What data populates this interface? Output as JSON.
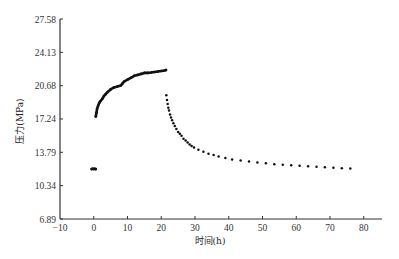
{
  "chart_data": {
    "type": "scatter",
    "title": "",
    "xlabel": "时间(h)",
    "ylabel": "压力(MPa)",
    "xlim": [
      -10,
      85
    ],
    "ylim": [
      6.89,
      27.58
    ],
    "xticks": [
      -10,
      0,
      10,
      20,
      30,
      40,
      50,
      60,
      70,
      80
    ],
    "yticks": [
      6.89,
      10.34,
      13.79,
      17.24,
      20.68,
      24.13,
      27.58
    ],
    "ytick_labels": [
      "6.89",
      "10.34",
      "13.79",
      "17.24",
      "20.68",
      "24.13",
      "27.58"
    ],
    "grid": false,
    "legend": null,
    "series": [
      {
        "name": "initial",
        "points": [
          [
            -0.6,
            12.05
          ],
          [
            -0.3,
            12.08
          ],
          [
            0.0,
            12.06
          ],
          [
            0.3,
            12.07
          ],
          [
            0.6,
            12.05
          ]
        ]
      },
      {
        "name": "buildup",
        "points": [
          [
            0.6,
            17.5
          ],
          [
            0.8,
            17.9
          ],
          [
            1.0,
            18.3
          ],
          [
            1.3,
            18.6
          ],
          [
            1.6,
            18.9
          ],
          [
            2.0,
            19.1
          ],
          [
            2.5,
            19.3
          ],
          [
            3.0,
            19.6
          ],
          [
            3.5,
            19.8
          ],
          [
            4.0,
            20.0
          ],
          [
            5.0,
            20.3
          ],
          [
            6.0,
            20.5
          ],
          [
            7.0,
            20.6
          ],
          [
            8.0,
            20.7
          ],
          [
            8.5,
            20.9
          ],
          [
            9.0,
            21.1
          ],
          [
            10.0,
            21.3
          ],
          [
            11.0,
            21.5
          ],
          [
            12.0,
            21.7
          ],
          [
            13.0,
            21.8
          ],
          [
            14.0,
            21.9
          ],
          [
            15.0,
            22.0
          ],
          [
            16.0,
            22.0
          ],
          [
            17.0,
            22.05
          ],
          [
            18.0,
            22.1
          ],
          [
            19.0,
            22.15
          ],
          [
            20.0,
            22.2
          ],
          [
            21.0,
            22.25
          ],
          [
            21.4,
            22.3
          ]
        ]
      },
      {
        "name": "falloff",
        "points": [
          [
            21.5,
            19.7
          ],
          [
            21.7,
            19.2
          ],
          [
            21.9,
            18.8
          ],
          [
            22.1,
            18.4
          ],
          [
            22.3,
            18.1
          ],
          [
            22.6,
            17.7
          ],
          [
            22.9,
            17.4
          ],
          [
            23.2,
            17.1
          ],
          [
            23.6,
            16.8
          ],
          [
            24.0,
            16.5
          ],
          [
            24.5,
            16.2
          ],
          [
            25.0,
            15.9
          ],
          [
            25.5,
            15.7
          ],
          [
            26.0,
            15.5
          ],
          [
            26.6,
            15.2
          ],
          [
            27.2,
            15.0
          ],
          [
            27.8,
            14.8
          ],
          [
            28.4,
            14.6
          ],
          [
            29.0,
            14.45
          ],
          [
            29.7,
            14.3
          ],
          [
            31.0,
            14.05
          ],
          [
            32.5,
            13.85
          ],
          [
            34.0,
            13.65
          ],
          [
            35.5,
            13.5
          ],
          [
            37.0,
            13.35
          ],
          [
            39.0,
            13.2
          ],
          [
            41.0,
            13.05
          ],
          [
            43.5,
            12.95
          ],
          [
            46.0,
            12.85
          ],
          [
            48.5,
            12.75
          ],
          [
            51.0,
            12.65
          ],
          [
            53.5,
            12.55
          ],
          [
            56.0,
            12.5
          ],
          [
            58.5,
            12.45
          ],
          [
            61.0,
            12.4
          ],
          [
            63.5,
            12.35
          ],
          [
            66.0,
            12.3
          ],
          [
            68.5,
            12.25
          ],
          [
            71.0,
            12.2
          ],
          [
            73.5,
            12.15
          ],
          [
            76.0,
            12.1
          ]
        ]
      }
    ]
  },
  "colors": {
    "axis": "#333333",
    "marker": "#111111",
    "background": "#ffffff"
  }
}
